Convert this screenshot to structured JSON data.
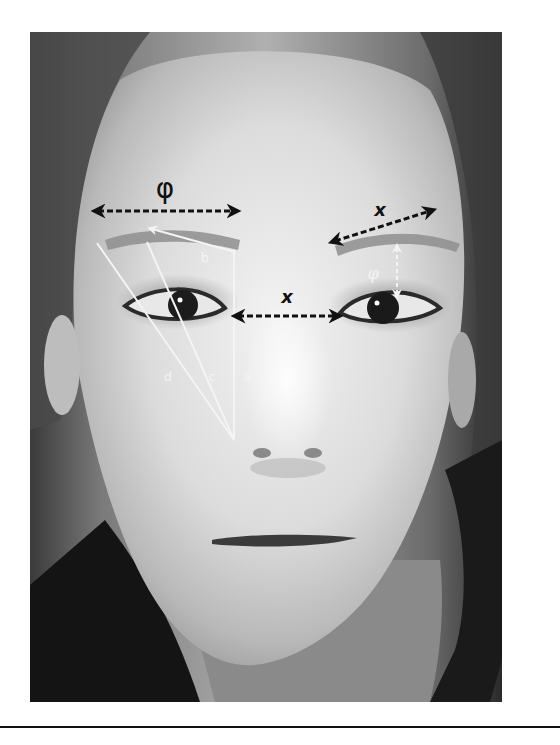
{
  "figure": {
    "colors": {
      "dark_arrow": "#111111",
      "white_line": "#f4f4f4",
      "background": "#ffffff",
      "rule": "#111111"
    },
    "annotations": {
      "brow_width": {
        "label": "φ",
        "type": "double-arrow",
        "color": "dark"
      },
      "brow_arch": {
        "label": "x",
        "type": "double-arrow",
        "color": "dark"
      },
      "intercanthal": {
        "label": "x",
        "type": "double-arrow",
        "color": "dark"
      },
      "brow_eye_gap": {
        "label": "φ",
        "type": "double-arrow-dashed",
        "color": "white"
      },
      "line_a": {
        "label": "a",
        "type": "line",
        "color": "white"
      },
      "line_b": {
        "label": "b",
        "type": "arrow",
        "color": "white"
      },
      "line_c": {
        "label": "c",
        "type": "line",
        "color": "white"
      },
      "line_d": {
        "label": "d",
        "type": "line",
        "color": "white"
      }
    }
  }
}
